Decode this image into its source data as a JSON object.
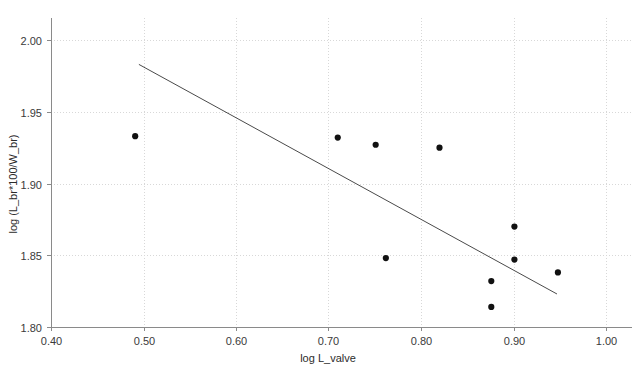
{
  "chart_data": {
    "type": "scatter",
    "title": "",
    "xlabel": "log L_valve",
    "ylabel": "log (L_br*100/W_br)",
    "xlim": [
      0.4,
      1.0
    ],
    "ylim": [
      1.8,
      2.0
    ],
    "xticks": [
      "0.40",
      "0.50",
      "0.60",
      "0.70",
      "0.80",
      "0.90",
      "1.00"
    ],
    "xtick_values": [
      0.4,
      0.5,
      0.6,
      0.7,
      0.8,
      0.9,
      1.0
    ],
    "yticks": [
      "1.80",
      "1.85",
      "1.90",
      "1.95",
      "2.00"
    ],
    "ytick_values": [
      1.8,
      1.85,
      1.9,
      1.95,
      2.0
    ],
    "grid": "dotted-light-gray-both-axes",
    "legend": "none",
    "point_color": "#111111",
    "line_color": "#4a4a4a",
    "grid_color": "#d8d8d8",
    "axis_color": "#8a8a8a",
    "x": [
      0.491,
      0.71,
      0.751,
      0.82,
      0.762,
      0.901,
      0.901,
      0.876,
      0.876,
      0.948
    ],
    "y": [
      1.933,
      1.932,
      1.927,
      1.925,
      1.848,
      1.87,
      1.847,
      1.832,
      1.814,
      1.838
    ],
    "points": [
      {
        "x": 0.491,
        "y": 1.933
      },
      {
        "x": 0.71,
        "y": 1.932
      },
      {
        "x": 0.751,
        "y": 1.927
      },
      {
        "x": 0.82,
        "y": 1.925
      },
      {
        "x": 0.762,
        "y": 1.848
      },
      {
        "x": 0.901,
        "y": 1.87
      },
      {
        "x": 0.901,
        "y": 1.847
      },
      {
        "x": 0.876,
        "y": 1.832
      },
      {
        "x": 0.876,
        "y": 1.814
      },
      {
        "x": 0.948,
        "y": 1.838
      }
    ],
    "trend_line": {
      "x_start": 0.495,
      "y_start": 1.983,
      "x_end": 0.947,
      "y_end": 1.823
    }
  }
}
